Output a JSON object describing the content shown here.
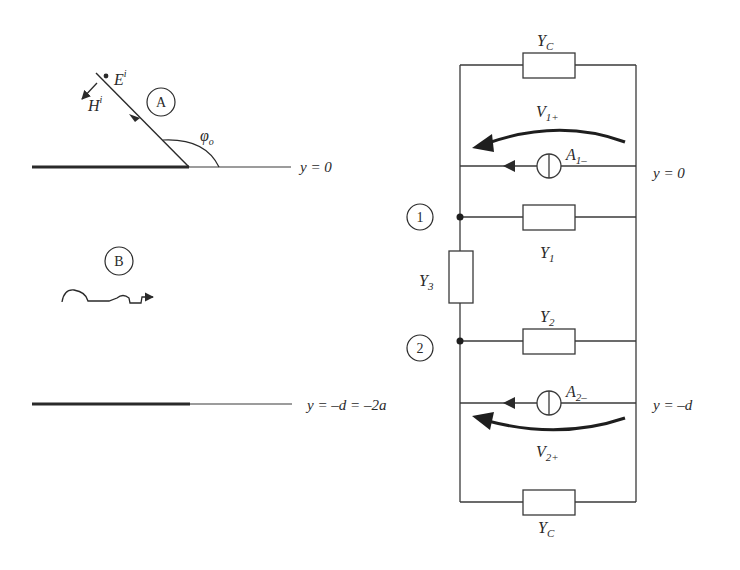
{
  "left_panel": {
    "region_a_label": "A",
    "region_b_label": "B",
    "incident_e_field": "E",
    "incident_e_superscript": "i",
    "incident_h_field": "H",
    "incident_h_superscript": "i",
    "angle_label": "φ",
    "angle_subscript": "o",
    "top_boundary_label": "y = 0",
    "bottom_boundary_label": "y = –d = –2a"
  },
  "circuit": {
    "node1_label": "1",
    "node2_label": "2",
    "top_admittance": {
      "main": "Y",
      "sub": "C"
    },
    "bottom_admittance": {
      "main": "Y",
      "sub": "C"
    },
    "y1": {
      "main": "Y",
      "sub": "1"
    },
    "y2": {
      "main": "Y",
      "sub": "2"
    },
    "y3": {
      "main": "Y",
      "sub": "3"
    },
    "source1": {
      "main": "A",
      "sub": "1–"
    },
    "source2": {
      "main": "A",
      "sub": "2–"
    },
    "voltage1": {
      "main": "V",
      "sub": "1+"
    },
    "voltage2": {
      "main": "V",
      "sub": "2+"
    },
    "top_port_label": "y = 0",
    "bottom_port_label": "y = –d"
  },
  "colors": {
    "ink": "#2a2a2a",
    "background": "#ffffff"
  }
}
